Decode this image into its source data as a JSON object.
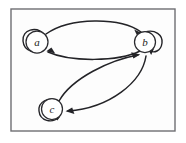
{
  "figure": {
    "kind": "state-transition-diagram",
    "width": 186,
    "height": 143,
    "background_color": "#ffffff",
    "panel_fill": "#fdfdfd",
    "frame_color": "#6e6e72",
    "ink_color": "#232327"
  },
  "nodes": [
    {
      "id": "a",
      "label": "a",
      "cx": 37,
      "cy": 42,
      "r": 11
    },
    {
      "id": "b",
      "label": "b",
      "cx": 145,
      "cy": 42,
      "r": 10.5
    },
    {
      "id": "c",
      "label": "c",
      "cx": 52,
      "cy": 109,
      "r": 10.5
    }
  ],
  "edges": [
    {
      "id": "a-to-b",
      "from": "a",
      "to": "b",
      "style": "curved-upper"
    },
    {
      "id": "b-to-a",
      "from": "b",
      "to": "a",
      "style": "curved-lower"
    },
    {
      "id": "c-to-b",
      "from": "c",
      "to": "b",
      "style": "curved-upper"
    },
    {
      "id": "b-to-c",
      "from": "b",
      "to": "c",
      "style": "curved-lower"
    },
    {
      "id": "a-self",
      "from": "a",
      "to": "a",
      "style": "self-loop"
    },
    {
      "id": "b-self",
      "from": "b",
      "to": "b",
      "style": "self-loop"
    },
    {
      "id": "c-self",
      "from": "c",
      "to": "c",
      "style": "self-loop"
    }
  ]
}
